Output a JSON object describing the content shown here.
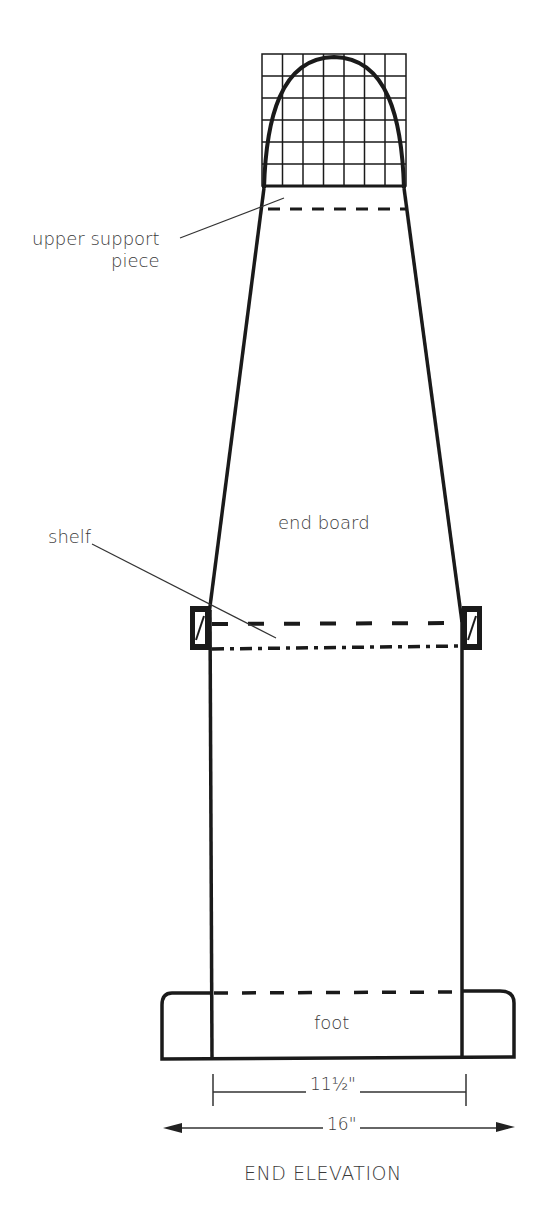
{
  "diagram": {
    "title": "END ELEVATION",
    "labels": {
      "upper_support_line1": "upper support",
      "upper_support_line2": "piece",
      "end_board": "end board",
      "shelf": "shelf",
      "foot": "foot"
    },
    "dimensions": {
      "inner_width": "11½\"",
      "outer_width": "16\""
    },
    "colors": {
      "line": "#1a1a1a",
      "text": "#3a3a3a",
      "background": "#ffffff"
    },
    "grid": {
      "columns": 7,
      "rows": 6
    }
  }
}
